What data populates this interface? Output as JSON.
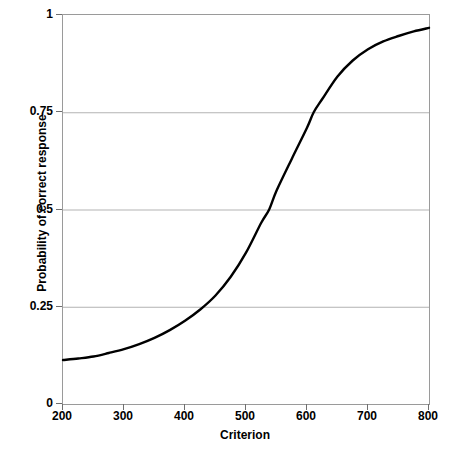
{
  "chart_data": {
    "type": "line",
    "title": "",
    "xlabel": "Criterion",
    "ylabel": "Probability of correct response",
    "xlim": [
      200,
      800
    ],
    "ylim": [
      0,
      1
    ],
    "grid": true,
    "legend": "none",
    "xticks": [
      "200",
      "300",
      "400",
      "500",
      "600",
      "700",
      "800"
    ],
    "xtick_values": [
      200,
      300,
      400,
      500,
      600,
      700,
      800
    ],
    "yticks": [
      "0",
      "0.25",
      "0.5",
      "0.75",
      "1"
    ],
    "ytick_values": [
      0,
      0.25,
      0.5,
      0.75,
      1
    ],
    "series": [
      {
        "name": "Probability of correct response",
        "color": "#000000",
        "line_width": 2.4,
        "x": [
          200,
          225,
          250,
          275,
          300,
          325,
          350,
          375,
          400,
          425,
          450,
          475,
          500,
          525,
          538,
          550,
          575,
          600,
          611,
          625,
          650,
          675,
          700,
          725,
          750,
          775,
          800
        ],
        "values": [
          0.113,
          0.117,
          0.122,
          0.131,
          0.141,
          0.154,
          0.17,
          0.19,
          0.214,
          0.243,
          0.279,
          0.327,
          0.389,
          0.466,
          0.5,
          0.548,
          0.63,
          0.71,
          0.75,
          0.784,
          0.842,
          0.883,
          0.912,
          0.932,
          0.946,
          0.958,
          0.967
        ]
      }
    ],
    "annotations": {
      "crossing_025": 439,
      "crossing_050": 538,
      "crossing_075": 611,
      "start_value": 0.113,
      "end_value": 0.967
    },
    "colors": {
      "curve": "#000000",
      "gridline": "#b3b3b3",
      "frame": "#9a9a9a",
      "background": "#ffffff"
    }
  },
  "caption": {
    "text": ""
  }
}
